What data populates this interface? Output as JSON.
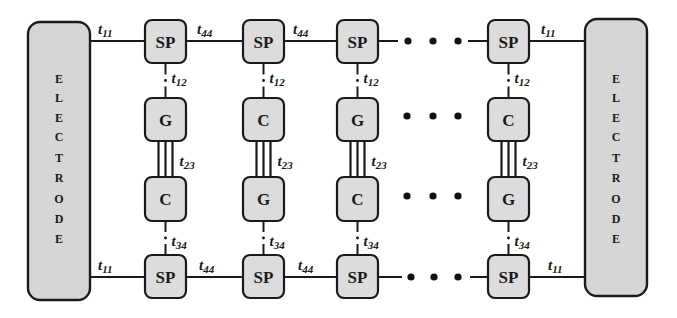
{
  "diagram": {
    "title": "",
    "electrodes": [
      {
        "id": "left",
        "label": "ELECTRODE",
        "letters": [
          "E",
          "L",
          "E",
          "C",
          "T",
          "R",
          "O",
          "D",
          "E"
        ]
      },
      {
        "id": "right",
        "label": "ELECTRODE",
        "letters": [
          "E",
          "L",
          "E",
          "C",
          "T",
          "R",
          "O",
          "D",
          "E"
        ]
      }
    ],
    "columns": [
      {
        "top": "SP",
        "upper": "G",
        "lower": "C",
        "bottom": "SP"
      },
      {
        "top": "SP",
        "upper": "C",
        "lower": "G",
        "bottom": "SP"
      },
      {
        "top": "SP",
        "upper": "G",
        "lower": "C",
        "bottom": "SP"
      },
      {
        "top": "SP",
        "upper": "C",
        "lower": "G",
        "bottom": "SP"
      }
    ],
    "couplings": {
      "electrode_sp": {
        "base": "t",
        "sub": "11"
      },
      "sp_sp": {
        "base": "t",
        "sub": "44"
      },
      "sp_upper": {
        "base": "t",
        "sub": "12"
      },
      "upper_lower": {
        "base": "t",
        "sub": "23"
      },
      "lower_sp": {
        "base": "t",
        "sub": "34"
      }
    },
    "ellipsis": "• • •",
    "colors": {
      "box_fill": "#dcdcdc",
      "electrode_fill": "#d6d6d6",
      "stroke": "#1a1a1a"
    }
  }
}
